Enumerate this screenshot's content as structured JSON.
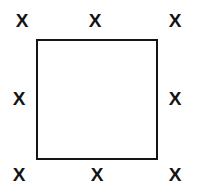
{
  "figure": {
    "canvas": {
      "width": 197,
      "height": 193,
      "background_color": "#ffffff"
    },
    "square": {
      "label": "square-outline",
      "x": 36,
      "y": 39,
      "width": 122,
      "height": 121,
      "border_width": 2,
      "border_color": "#141414",
      "fill_color": "#ffffff"
    },
    "mark_glyph": "X",
    "mark_color": "#141414",
    "mark_font_size": 19,
    "marks": [
      {
        "name": "x-mark-top-left",
        "position": "top-left",
        "glyph": "X",
        "cx": 22,
        "cy": 20
      },
      {
        "name": "x-mark-top-center",
        "position": "top-center",
        "glyph": "X",
        "cx": 95,
        "cy": 20
      },
      {
        "name": "x-mark-top-right",
        "position": "top-right",
        "glyph": "X",
        "cx": 175,
        "cy": 20
      },
      {
        "name": "x-mark-middle-left",
        "position": "middle-left",
        "glyph": "X",
        "cx": 19,
        "cy": 98
      },
      {
        "name": "x-mark-middle-right",
        "position": "middle-right",
        "glyph": "X",
        "cx": 175,
        "cy": 98
      },
      {
        "name": "x-mark-bottom-left",
        "position": "bottom-left",
        "glyph": "X",
        "cx": 19,
        "cy": 174
      },
      {
        "name": "x-mark-bottom-center",
        "position": "bottom-center",
        "glyph": "X",
        "cx": 97,
        "cy": 174
      },
      {
        "name": "x-mark-bottom-right",
        "position": "bottom-right",
        "glyph": "X",
        "cx": 175,
        "cy": 174
      }
    ]
  }
}
